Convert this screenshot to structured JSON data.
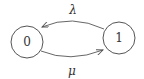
{
  "diagram": {
    "type": "state-transition",
    "nodes": [
      {
        "id": "0",
        "label": "0"
      },
      {
        "id": "1",
        "label": "1"
      }
    ],
    "edges": [
      {
        "from": "1",
        "to": "0",
        "label": "λ",
        "position": "top"
      },
      {
        "from": "0",
        "to": "1",
        "label": "μ",
        "position": "bottom"
      }
    ]
  }
}
